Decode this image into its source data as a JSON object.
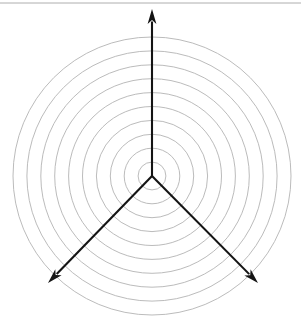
{
  "figure": {
    "name": "polar-grid-diagram",
    "background_color": "#ffffff",
    "width": 301,
    "height": 320
  },
  "top_rule": {
    "name": "top-divider",
    "color": "#9a9a9a",
    "y": 3,
    "x_start": 0,
    "x_end": 301,
    "thickness": 0.8
  },
  "chart_data": {
    "type": "scatter",
    "title": "",
    "subtitle": "",
    "xlabel": "",
    "ylabel": "",
    "grid": true,
    "legend_position": "none",
    "projection": "polar",
    "center": {
      "x": 152,
      "y": 176
    },
    "grid_circles": {
      "count": 10,
      "color": "#b3b3b3",
      "stroke_width": 0.9,
      "radii": [
        13.9,
        27.8,
        41.7,
        55.6,
        69.5,
        83.4,
        97.3,
        111.2,
        125.1,
        139.0
      ],
      "outer_radius": 139.0,
      "spacing": 13.9
    },
    "axes": [
      {
        "name": "axis-up",
        "angle_deg": 90,
        "label": "",
        "tip": {
          "x": 152,
          "y": 9
        },
        "color": "#141414"
      },
      {
        "name": "axis-lower-left",
        "angle_deg": 210,
        "label": "",
        "tip": {
          "x": 48,
          "y": 283
        },
        "color": "#141414"
      },
      {
        "name": "axis-lower-right",
        "angle_deg": 330,
        "label": "",
        "tip": {
          "x": 258,
          "y": 283
        },
        "color": "#141414"
      }
    ],
    "categories": [],
    "values": [],
    "series": [],
    "annotations": [],
    "tick_labels": []
  }
}
